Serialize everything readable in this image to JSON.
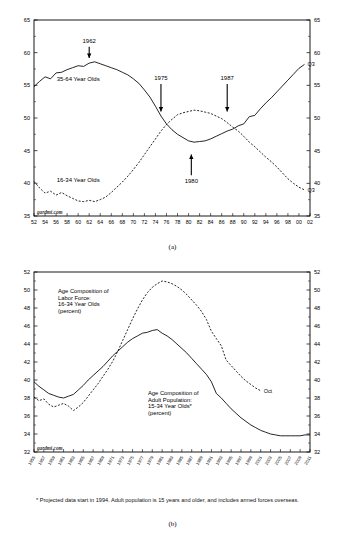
{
  "figure": {
    "panel_a_caption": "(a)",
    "panel_b_caption": "(b)",
    "watermark": "gardmi.com",
    "footnote": "* Projected data start in 1994. Adult population is 15 years and older, and includes armed forces overseas."
  },
  "chart_data": [
    {
      "id": "panel-a",
      "type": "line",
      "title": "",
      "xlabel": "",
      "ylabel": "",
      "xlim": [
        1952,
        2002
      ],
      "ylim": [
        35,
        65
      ],
      "ytick_values": [
        35,
        40,
        45,
        50,
        55,
        60,
        65
      ],
      "ytick_labels": [
        "35",
        "40",
        "45",
        "50",
        "55",
        "60",
        "65"
      ],
      "ytick_labels_right": [
        "35",
        "40",
        "45",
        "50",
        "55",
        "60",
        "65"
      ],
      "xtick_values": [
        1952,
        1954,
        1956,
        1958,
        1960,
        1962,
        1964,
        1966,
        1968,
        1970,
        1972,
        1974,
        1976,
        1978,
        1980,
        1982,
        1984,
        1986,
        1988,
        1990,
        1992,
        1994,
        1996,
        1998,
        2000,
        2002
      ],
      "xtick_labels": [
        "52",
        "54",
        "56",
        "58",
        "60",
        "62",
        "64",
        "66",
        "68",
        "70",
        "72",
        "74",
        "76",
        "78",
        "80",
        "82",
        "84",
        "86",
        "88",
        "90",
        "92",
        "94",
        "96",
        "98",
        "00",
        "02"
      ],
      "grid": false,
      "legend_position": "inline",
      "series": [
        {
          "name": "35-64 Year Olds",
          "style": "solid",
          "label_x": 1960,
          "label_y": 55.6,
          "endpoint_label": "Q3",
          "x": [
            1952,
            1953,
            1954,
            1955,
            1956,
            1957,
            1958,
            1959,
            1960,
            1961,
            1962,
            1963,
            1964,
            1965,
            1966,
            1967,
            1968,
            1969,
            1970,
            1971,
            1972,
            1973,
            1974,
            1975,
            1976,
            1977,
            1978,
            1979,
            1980,
            1981,
            1982,
            1983,
            1984,
            1985,
            1986,
            1987,
            1988,
            1989,
            1990,
            1991,
            1992,
            1993,
            1994,
            1995,
            1996,
            1997,
            1998,
            1999,
            2000,
            2001
          ],
          "y": [
            54.8,
            55.6,
            56.3,
            56.0,
            56.9,
            57.0,
            57.4,
            57.7,
            58.0,
            57.9,
            58.4,
            58.6,
            58.3,
            58.0,
            57.7,
            57.4,
            57.0,
            56.6,
            56.0,
            55.3,
            54.3,
            53.2,
            51.8,
            50.3,
            49.1,
            48.2,
            47.5,
            47.0,
            46.5,
            46.3,
            46.4,
            46.5,
            46.8,
            47.2,
            47.6,
            48.0,
            48.3,
            48.8,
            49.1,
            50.2,
            50.4,
            51.4,
            52.3,
            53.1,
            54.0,
            54.9,
            55.8,
            56.7,
            57.6,
            58.2
          ]
        },
        {
          "name": "16-34 Year Olds",
          "style": "dashed",
          "label_x": 1960,
          "label_y": 40.2,
          "endpoint_label": "Q3",
          "x": [
            1952,
            1953,
            1954,
            1955,
            1956,
            1957,
            1958,
            1959,
            1960,
            1961,
            1962,
            1963,
            1964,
            1965,
            1966,
            1967,
            1968,
            1969,
            1970,
            1971,
            1972,
            1973,
            1974,
            1975,
            1976,
            1977,
            1978,
            1979,
            1980,
            1981,
            1982,
            1983,
            1984,
            1985,
            1986,
            1987,
            1988,
            1989,
            1990,
            1991,
            1992,
            1993,
            1994,
            1995,
            1996,
            1997,
            1998,
            1999,
            2000,
            2001
          ],
          "y": [
            40.3,
            39.3,
            38.5,
            38.8,
            38.2,
            38.6,
            38.1,
            37.7,
            37.3,
            37.2,
            37.4,
            37.2,
            37.5,
            37.9,
            38.6,
            39.4,
            40.2,
            41.1,
            42.1,
            43.2,
            44.4,
            45.6,
            46.8,
            48.0,
            49.0,
            49.8,
            50.5,
            50.8,
            51.0,
            51.2,
            51.1,
            50.9,
            50.7,
            50.3,
            49.9,
            49.3,
            48.6,
            48.0,
            47.2,
            46.3,
            45.6,
            44.8,
            44.0,
            43.3,
            42.5,
            41.6,
            40.7,
            40.0,
            39.4,
            39.0
          ]
        }
      ],
      "annotations": [
        {
          "label": "1962",
          "x": 1962,
          "y_text": 61.5,
          "arrow_to_y": 59.2,
          "direction": "down"
        },
        {
          "label": "1975",
          "x": 1975,
          "y_text": 55.8,
          "arrow_to_y": 51.0,
          "direction": "down"
        },
        {
          "label": "1987",
          "x": 1987,
          "y_text": 55.8,
          "arrow_to_y": 51.0,
          "direction": "down"
        },
        {
          "label": "1980",
          "x": 1980.5,
          "y_text": 40.0,
          "arrow_to_y": 44.4,
          "direction": "up"
        }
      ]
    },
    {
      "id": "panel-b",
      "type": "line",
      "title": "",
      "xlabel": "",
      "ylabel": "",
      "xlim": [
        1955,
        2011
      ],
      "ylim": [
        32,
        52
      ],
      "ytick_values": [
        32,
        34,
        36,
        38,
        40,
        42,
        44,
        46,
        48,
        50,
        52
      ],
      "ytick_labels": [
        "32",
        "34",
        "36",
        "38",
        "40",
        "42",
        "44",
        "46",
        "48",
        "50",
        "52"
      ],
      "ytick_labels_right": [
        "32",
        "34",
        "36",
        "38",
        "40",
        "42",
        "44",
        "46",
        "48",
        "50",
        "52"
      ],
      "xtick_values": [
        1955,
        1957,
        1959,
        1961,
        1963,
        1965,
        1967,
        1969,
        1971,
        1973,
        1975,
        1977,
        1979,
        1981,
        1983,
        1985,
        1987,
        1989,
        1991,
        1993,
        1995,
        1997,
        1999,
        2001,
        2003,
        2005,
        2007,
        2009,
        2011
      ],
      "xtick_labels": [
        "1955",
        "1957",
        "1959",
        "1961",
        "1963",
        "1965",
        "1967",
        "1969",
        "1971",
        "1973",
        "1975",
        "1977",
        "1979",
        "1981",
        "1983",
        "1985",
        "1987",
        "1989",
        "1991",
        "1993",
        "1995",
        "1997",
        "1999",
        "2001",
        "2003",
        "2005",
        "2007",
        "2009",
        "2011"
      ],
      "grid": false,
      "legend_position": "inline",
      "series": [
        {
          "name": "Age Composition of Labor Force: 16-34 Year Olds (percent)",
          "label_lines": [
            "Age Composition of",
            "Labor Force:",
            "16-34 Year Olds",
            "(percent)"
          ],
          "style": "dashed",
          "endpoint_label": "Oct",
          "x": [
            1955,
            1956,
            1957,
            1958,
            1959,
            1960,
            1961,
            1962,
            1963,
            1964,
            1965,
            1966,
            1967,
            1968,
            1969,
            1970,
            1971,
            1972,
            1973,
            1974,
            1975,
            1976,
            1977,
            1978,
            1979,
            1980,
            1981,
            1982,
            1983,
            1984,
            1985,
            1986,
            1987,
            1988,
            1989,
            1990,
            1991,
            1992,
            1993,
            1994,
            1995,
            1996,
            1997,
            1998,
            1999,
            2000,
            2001
          ],
          "y": [
            38.1,
            37.7,
            37.9,
            37.3,
            37.0,
            37.2,
            37.4,
            37.1,
            36.6,
            37.0,
            37.5,
            38.2,
            38.9,
            39.6,
            40.4,
            41.2,
            42.1,
            43.2,
            44.4,
            45.6,
            46.8,
            47.9,
            48.9,
            49.7,
            50.3,
            50.7,
            51.0,
            50.9,
            50.7,
            50.4,
            50.0,
            49.5,
            48.9,
            48.3,
            47.6,
            46.7,
            45.4,
            44.6,
            43.8,
            42.2,
            41.6,
            41.0,
            40.4,
            39.9,
            39.5,
            39.1,
            38.8
          ]
        },
        {
          "name": "Age Composition of Adult Population: 15-34 Year Olds* (percent)",
          "label_lines": [
            "Age Composition of",
            "Adult Population:",
            "15-34 Year Olds*",
            "(percent)"
          ],
          "style": "solid",
          "endpoint_label": "",
          "x": [
            1955,
            1956,
            1957,
            1958,
            1959,
            1960,
            1961,
            1962,
            1963,
            1964,
            1965,
            1966,
            1967,
            1968,
            1969,
            1970,
            1971,
            1972,
            1973,
            1974,
            1975,
            1976,
            1977,
            1978,
            1979,
            1980,
            1981,
            1982,
            1983,
            1984,
            1985,
            1986,
            1987,
            1988,
            1989,
            1990,
            1991,
            1992,
            1993,
            1994,
            1995,
            1996,
            1997,
            1998,
            1999,
            2000,
            2001,
            2002,
            2003,
            2004,
            2005,
            2006,
            2007,
            2008,
            2009,
            2010,
            2011
          ],
          "y": [
            39.8,
            39.3,
            38.9,
            38.5,
            38.3,
            38.1,
            38.0,
            38.2,
            38.4,
            38.9,
            39.4,
            40.0,
            40.5,
            41.0,
            41.5,
            42.1,
            42.7,
            43.2,
            43.7,
            44.2,
            44.6,
            44.9,
            45.2,
            45.3,
            45.5,
            45.6,
            45.2,
            44.9,
            44.5,
            44.0,
            43.5,
            43.0,
            42.4,
            41.8,
            41.2,
            40.6,
            39.8,
            38.5,
            38.0,
            37.4,
            36.8,
            36.3,
            35.8,
            35.4,
            35.0,
            34.7,
            34.4,
            34.2,
            34.0,
            33.9,
            33.8,
            33.8,
            33.8,
            33.8,
            33.8,
            33.9,
            33.9
          ]
        }
      ],
      "annotations": []
    }
  ]
}
